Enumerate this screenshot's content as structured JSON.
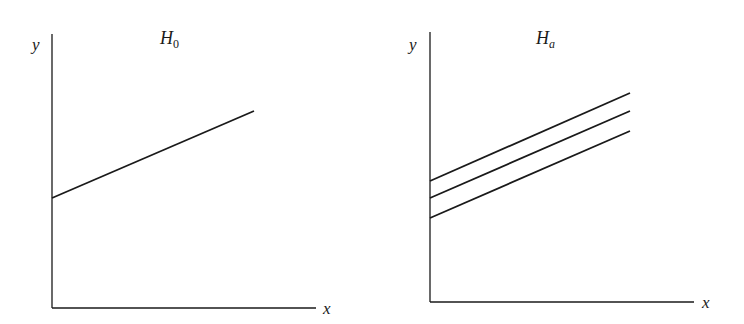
{
  "panels": [
    {
      "title": "H",
      "title_sub": "0",
      "ylabel": "y",
      "xlabel": "x",
      "lines": [
        {
          "x1": 52,
          "y1": 198,
          "x2": 254,
          "y2": 111
        }
      ]
    },
    {
      "title": "H",
      "title_sub": "a",
      "ylabel": "y",
      "xlabel": "x",
      "lines": [
        {
          "x1": 430,
          "y1": 181,
          "x2": 630,
          "y2": 93
        },
        {
          "x1": 430,
          "y1": 198,
          "x2": 630,
          "y2": 111
        },
        {
          "x1": 430,
          "y1": 218,
          "x2": 630,
          "y2": 131
        }
      ]
    }
  ],
  "colors": {
    "ink": "#1a1a1a",
    "background": "#ffffff"
  }
}
